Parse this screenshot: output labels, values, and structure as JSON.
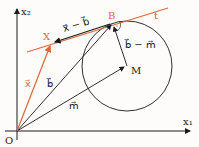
{
  "diagram": {
    "axes": {
      "x_label": "x₁",
      "y_label": "x₂",
      "origin_label": "O"
    },
    "points": {
      "B": "B",
      "X": "X",
      "M": "M"
    },
    "tangent_label": "t",
    "vectors": {
      "x": "x⃗",
      "b": "b⃗",
      "m": "m⃗",
      "x_minus_b": "x⃗ − b⃗",
      "b_minus_m": "b⃗ − m⃗"
    },
    "colors": {
      "accent": "#e0643a",
      "ink": "#1a1a1a"
    }
  }
}
